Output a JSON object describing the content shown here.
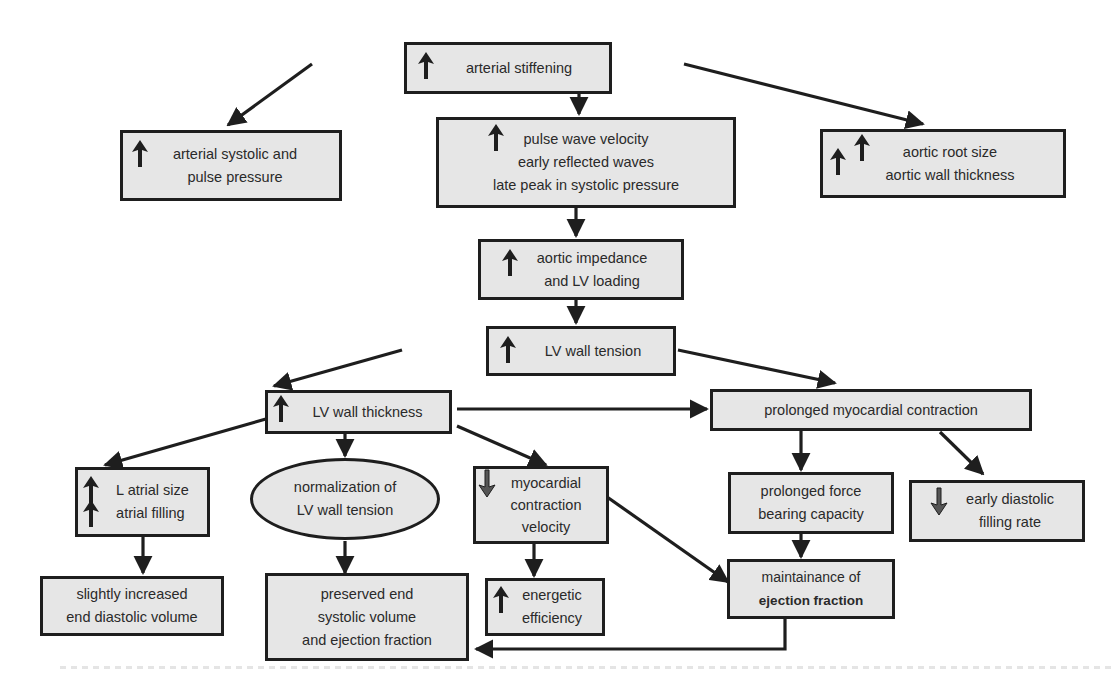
{
  "diagram": {
    "nodes": {
      "arterial_stiffening": {
        "lines": [
          "arterial stiffening"
        ],
        "indicator": "increase"
      },
      "arterial_pressure": {
        "lines": [
          "arterial systolic and",
          "pulse pressure"
        ],
        "indicator": "increase"
      },
      "pulse_wave": {
        "lines": [
          "pulse wave velocity",
          "early reflected waves",
          "late peak in systolic pressure"
        ],
        "indicator": "increase"
      },
      "aortic_root": {
        "lines": [
          "aortic root size",
          "aortic wall thickness"
        ],
        "indicator": "increase-double"
      },
      "aortic_impedance": {
        "lines": [
          "aortic impedance",
          "and LV loading"
        ],
        "indicator": "increase"
      },
      "lv_wall_tension": {
        "lines": [
          "LV wall tension"
        ],
        "indicator": "increase"
      },
      "lv_wall_thickness": {
        "lines": [
          "LV wall thickness"
        ],
        "indicator": "increase"
      },
      "prolonged_contraction": {
        "lines": [
          "prolonged myocardial contraction"
        ],
        "indicator": "none"
      },
      "l_atrial": {
        "lines": [
          "L atrial size",
          "atrial filling"
        ],
        "indicator": "increase-double"
      },
      "normalization": {
        "lines": [
          "normalization of",
          "LV wall tension"
        ],
        "indicator": "none"
      },
      "myocardial_velocity": {
        "lines": [
          "myocardial",
          "contraction",
          "velocity"
        ],
        "indicator": "decrease"
      },
      "prolonged_force": {
        "lines": [
          "prolonged force",
          "bearing capacity"
        ],
        "indicator": "none"
      },
      "early_diastolic": {
        "lines": [
          "early diastolic",
          "filling rate"
        ],
        "indicator": "decrease"
      },
      "end_diastolic": {
        "lines": [
          "slightly increased",
          "end diastolic volume"
        ],
        "indicator": "none"
      },
      "preserved_end": {
        "lines": [
          "preserved end",
          "systolic volume",
          "and ejection fraction"
        ],
        "indicator": "none"
      },
      "energetic": {
        "lines": [
          "energetic",
          "efficiency"
        ],
        "indicator": "increase"
      },
      "maintainance": {
        "lines": [
          "maintainance of",
          "ejection fraction"
        ],
        "indicator": "none"
      }
    },
    "edges": [
      [
        "arterial_stiffening",
        "arterial_pressure"
      ],
      [
        "arterial_stiffening",
        "pulse_wave"
      ],
      [
        "arterial_stiffening",
        "aortic_root"
      ],
      [
        "pulse_wave",
        "aortic_impedance"
      ],
      [
        "aortic_impedance",
        "lv_wall_tension"
      ],
      [
        "lv_wall_tension",
        "lv_wall_thickness"
      ],
      [
        "lv_wall_tension",
        "prolonged_contraction"
      ],
      [
        "lv_wall_thickness",
        "prolonged_contraction"
      ],
      [
        "lv_wall_thickness",
        "l_atrial"
      ],
      [
        "lv_wall_thickness",
        "normalization"
      ],
      [
        "lv_wall_thickness",
        "myocardial_velocity"
      ],
      [
        "prolonged_contraction",
        "prolonged_force"
      ],
      [
        "prolonged_contraction",
        "early_diastolic"
      ],
      [
        "l_atrial",
        "end_diastolic"
      ],
      [
        "normalization",
        "preserved_end"
      ],
      [
        "myocardial_velocity",
        "energetic"
      ],
      [
        "myocardial_velocity",
        "maintainance"
      ],
      [
        "prolonged_force",
        "maintainance"
      ],
      [
        "maintainance",
        "preserved_end"
      ]
    ],
    "colors": {
      "node_fill": "#e6e6e6",
      "stroke": "#1e1e1e",
      "text": "#2a2a2a",
      "decrease_arrow": "#555555"
    }
  }
}
